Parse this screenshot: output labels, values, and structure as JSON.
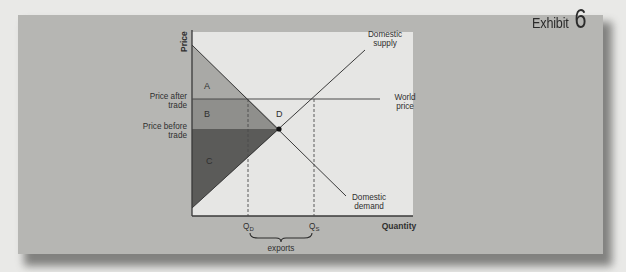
{
  "exhibit": {
    "label": "Exhibit",
    "number": "6"
  },
  "axes": {
    "y_label": "Price",
    "x_label": "Quantity"
  },
  "price_labels": {
    "after_trade": [
      "Price after",
      "trade"
    ],
    "before_trade": [
      "Price before",
      "trade"
    ]
  },
  "curve_labels": {
    "supply": [
      "Domestic",
      "supply"
    ],
    "demand": [
      "Domestic",
      "demand"
    ],
    "world_price": [
      "World",
      "price"
    ]
  },
  "areas": {
    "a": "A",
    "b": "B",
    "c": "C",
    "d": "D"
  },
  "quantity_labels": {
    "qd": "Q",
    "qd_sub": "D",
    "qs": "Q",
    "qs_sub": "S",
    "brace_label": "exports"
  },
  "colors": {
    "panel": "#b6b6b3",
    "plot_bg": "#e6e6e4",
    "area_a": "#a9a9a6",
    "area_b": "#8f8f8c",
    "area_c": "#5b5b59",
    "line": "#3a3a3a"
  }
}
